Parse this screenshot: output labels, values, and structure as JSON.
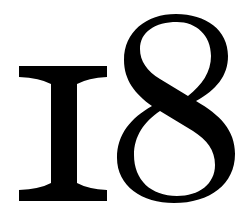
{
  "figure": {
    "text": "18",
    "glyphs": [
      {
        "char": "1",
        "style": "old-style serif numeral resembling capital I"
      },
      {
        "char": "8",
        "style": "old-style serif numeral"
      }
    ],
    "colors": {
      "foreground": "#000000",
      "background": "#ffffff"
    }
  }
}
